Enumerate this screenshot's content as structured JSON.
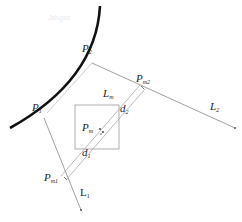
{
  "diagram": {
    "watermark": "Jsbgse",
    "points": {
      "P1": {
        "base": "P",
        "sub": "1"
      },
      "P2": {
        "base": "P",
        "sub": "2"
      },
      "Pm": {
        "base": "P",
        "sub": "m"
      },
      "Pm1": {
        "base": "P",
        "sub": "m1"
      },
      "Pm2": {
        "base": "P",
        "sub": "m2"
      }
    },
    "lines": {
      "L1": {
        "base": "L",
        "sub": "1"
      },
      "L2": {
        "base": "L",
        "sub": "2"
      },
      "Lm": {
        "base": "L",
        "sub": "m"
      }
    },
    "distances": {
      "d1": {
        "base": "d",
        "sub": "1"
      },
      "d2": {
        "base": "d",
        "sub": "2"
      }
    },
    "colors": {
      "arc": "#111111",
      "lines": "#888888",
      "box": "#999999",
      "text": "#222222"
    }
  }
}
